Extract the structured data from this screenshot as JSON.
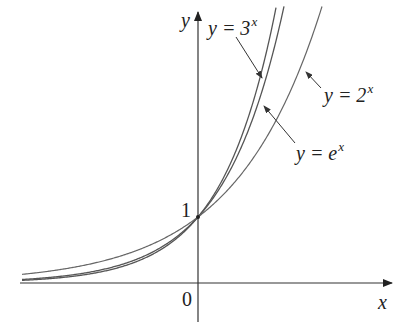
{
  "chart_data": {
    "type": "line",
    "title": "",
    "xlabel": "x",
    "ylabel": "y",
    "origin_label": "0",
    "y_tick_labels": [
      "1"
    ],
    "y_intercept": 1,
    "xlim": [
      -3,
      3.6
    ],
    "ylim": [
      -0.6,
      4.2
    ],
    "grid": false,
    "legend": "annotated labels with arrows",
    "series": [
      {
        "name": "y = 3^x",
        "base": 3,
        "label_base": "y = 3",
        "label_exp": "x"
      },
      {
        "name": "y = e^x",
        "base": 2.718281828,
        "label_base": "y = e",
        "label_exp": "x"
      },
      {
        "name": "y = 2^x",
        "base": 2,
        "label_base": "y = 2",
        "label_exp": "x"
      }
    ]
  },
  "labels": {
    "y_axis": "y",
    "x_axis": "x",
    "origin": "0",
    "one": "1",
    "three_base": "y = 3",
    "three_exp": "x",
    "e_base": "y = e",
    "e_exp": "x",
    "two_base": "y = 2",
    "two_exp": "x"
  },
  "colors": {
    "axis": "#333333",
    "curve": "#555555",
    "text": "#222222"
  }
}
